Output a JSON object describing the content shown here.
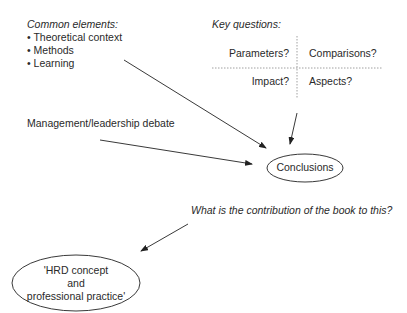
{
  "common_elements": {
    "heading": "Common elements:",
    "items": [
      "• Theoretical context",
      "• Methods",
      "• Learning"
    ]
  },
  "key_questions": {
    "heading": "Key questions:",
    "grid": {
      "top_left": "Parameters?",
      "top_right": "Comparisons?",
      "bottom_left": "Impact?",
      "bottom_right": "Aspects?"
    }
  },
  "management_debate": "Management/leadership debate",
  "conclusions": "Conclusions",
  "contribution_question": "What is the contribution of the book to this?",
  "hrd_box": {
    "line1": "'HRD concept",
    "line2": "and",
    "line3": "professional practice'"
  }
}
